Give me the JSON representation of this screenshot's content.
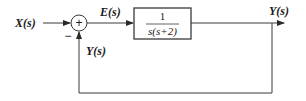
{
  "diagram": {
    "type": "feedback-control-block-diagram",
    "input_label": "X(s)",
    "error_label": "E(s)",
    "output_label": "Y(s)",
    "feedback_label": "Y(s)",
    "summing_junction": {
      "plus_sign": "+",
      "minus_sign": "−"
    },
    "transfer_block": {
      "numerator": "1",
      "denominator": "s(s+2)"
    },
    "colors": {
      "stroke": "#3a3a3a",
      "text": "#1a1a1a",
      "background": "#ffffff"
    }
  }
}
